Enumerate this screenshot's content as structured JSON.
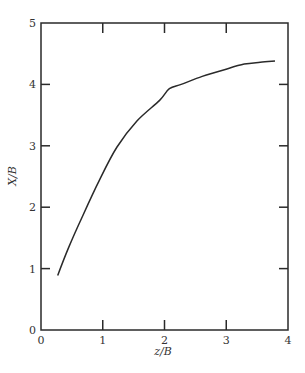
{
  "chart_data": {
    "type": "line",
    "title": "",
    "xlabel": "z/B",
    "ylabel": "X/B",
    "xlim": [
      0,
      4
    ],
    "ylim": [
      0,
      5
    ],
    "xticks": [
      "0",
      "1",
      "2",
      "3",
      "4"
    ],
    "yticks": [
      "0",
      "1",
      "2",
      "3",
      "4",
      "5"
    ],
    "grid": false,
    "legend": null,
    "series": [
      {
        "name": "X/B vs z/B",
        "x": [
          0.27,
          0.45,
          0.68,
          0.95,
          1.23,
          1.55,
          1.92,
          2.08,
          2.27,
          2.61,
          2.97,
          3.29,
          3.55,
          3.79
        ],
        "y": [
          0.89,
          1.35,
          1.87,
          2.45,
          2.98,
          3.4,
          3.74,
          3.93,
          4.0,
          4.13,
          4.24,
          4.33,
          4.36,
          4.38
        ]
      }
    ]
  }
}
